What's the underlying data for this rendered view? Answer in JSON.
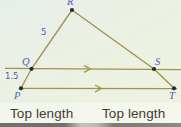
{
  "figure": {
    "points": {
      "R": {
        "label": "R"
      },
      "Q": {
        "label": "Q"
      },
      "S": {
        "label": "S"
      },
      "P": {
        "label": "P"
      },
      "T": {
        "label": "T"
      }
    },
    "measurements": {
      "RQ": "5",
      "QP": "1.5"
    },
    "captions": {
      "left": "Top length",
      "right": "Top length"
    },
    "colors": {
      "line": "#a3914e",
      "point_dot": "#232b46",
      "point_label": "#4c5fae",
      "caption_text": "#3c3f33",
      "background": "#ebf1e3"
    }
  }
}
